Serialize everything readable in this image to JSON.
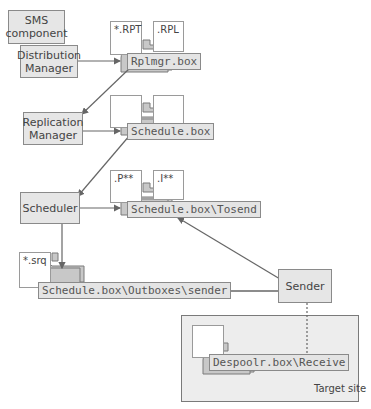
{
  "diagram": {
    "components": {
      "sms_component": "SMS\ncomponent",
      "distribution_manager": "Distribution\nManager",
      "replication_manager": "Replication\nManager",
      "scheduler": "Scheduler",
      "sender": "Sender"
    },
    "files": {
      "rpt": "*.RPT",
      "rpl": ".RPL",
      "p": ".P**",
      "i": ".I**",
      "srq": "*.srq"
    },
    "folders": {
      "rplmgr": "Rplmgr.box",
      "schedule": "Schedule.box",
      "tosend": "Schedule.box\\Tosend",
      "outboxes": "Schedule.box\\Outboxes\\sender",
      "receive": "Despoolr.box\\Receive"
    },
    "target_site": "Target site",
    "colors": {
      "box_fill": "#e6e6e6",
      "border": "#8a8a8a",
      "folder_fill": "#c8c8c8",
      "arrow": "#666666",
      "target_bg": "#ededed"
    }
  }
}
